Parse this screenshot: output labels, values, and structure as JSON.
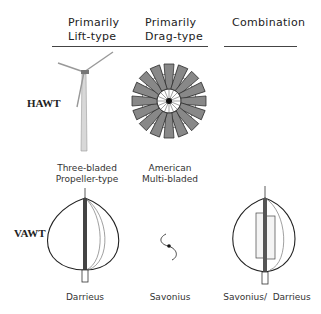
{
  "columns": {
    "lift": {
      "line1": "Primarily",
      "line2": "Lift-type"
    },
    "drag": {
      "line1": "Primarily",
      "line2": "Drag-type"
    },
    "combo": {
      "line1": "Combination"
    }
  },
  "rows": {
    "hawt": "HAWT",
    "vawt": "VAWT"
  },
  "captions": {
    "three_bladed": {
      "line1": "Three-bladed",
      "line2": "Propeller-type"
    },
    "american": {
      "line1": "American",
      "line2": "Multi-bladed"
    },
    "darrieus": "Darrieus",
    "savonius": "Savonius",
    "savonius_darrieus": "Savonius/  Darrieus"
  }
}
